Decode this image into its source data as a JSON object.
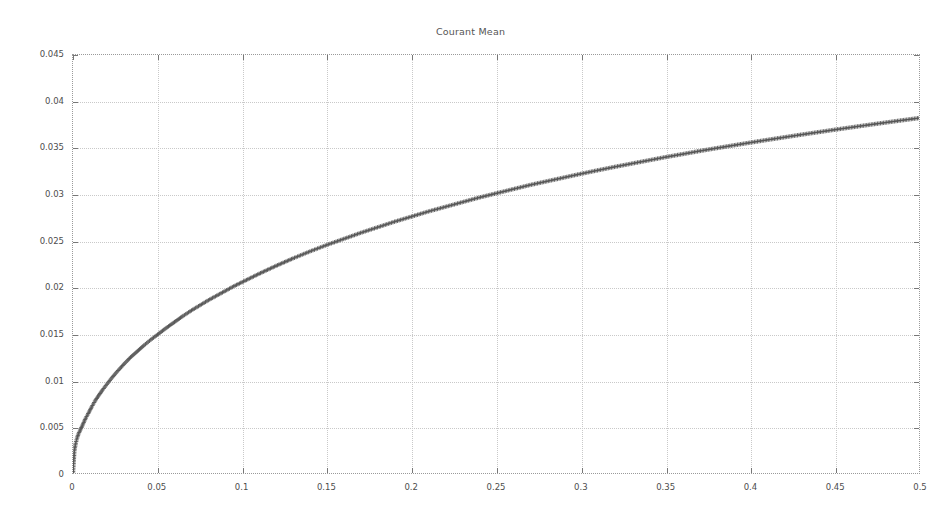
{
  "chart_data": {
    "type": "scatter",
    "title": "Courant Mean",
    "xlabel": "",
    "ylabel": "",
    "xlim": [
      0,
      0.5
    ],
    "ylim": [
      0,
      0.045
    ],
    "grid": true,
    "legend_position": "top-right",
    "x_ticks": [
      "0",
      "0.05",
      "0.1",
      "0.15",
      "0.2",
      "0.25",
      "0.3",
      "0.35",
      "0.4",
      "0.45",
      "0.5"
    ],
    "x_tick_values": [
      0,
      0.05,
      0.1,
      0.15,
      0.2,
      0.25,
      0.3,
      0.35,
      0.4,
      0.45,
      0.5
    ],
    "y_ticks": [
      "0",
      "0.005",
      "0.01",
      "0.015",
      "0.02",
      "0.025",
      "0.03",
      "0.035",
      "0.04",
      "0.045"
    ],
    "y_tick_values": [
      0,
      0.005,
      0.01,
      0.015,
      0.02,
      0.025,
      0.03,
      0.035,
      0.04,
      0.045
    ],
    "series": [
      {
        "name": "\"CourantMean_0\"",
        "marker": "plus",
        "color": "#555555",
        "x": [
          0.0,
          0.0008,
          0.0016,
          0.0024,
          0.0032,
          0.004,
          0.005,
          0.006,
          0.0075,
          0.009,
          0.011,
          0.013,
          0.015,
          0.0175,
          0.02,
          0.023,
          0.026,
          0.03,
          0.034,
          0.038,
          0.042,
          0.046,
          0.05,
          0.055,
          0.06,
          0.065,
          0.07,
          0.075,
          0.08,
          0.085,
          0.09,
          0.095,
          0.1,
          0.11,
          0.12,
          0.13,
          0.14,
          0.15,
          0.16,
          0.17,
          0.18,
          0.19,
          0.2,
          0.21,
          0.22,
          0.23,
          0.24,
          0.25,
          0.26,
          0.27,
          0.28,
          0.29,
          0.3,
          0.31,
          0.32,
          0.33,
          0.34,
          0.35,
          0.36,
          0.37,
          0.38,
          0.39,
          0.4,
          0.41,
          0.42,
          0.43,
          0.44,
          0.45,
          0.46,
          0.47,
          0.48,
          0.49,
          0.5
        ],
        "y": [
          0.0,
          0.0024,
          0.0032,
          0.00375,
          0.0042,
          0.0045,
          0.0049,
          0.0053,
          0.0059,
          0.0064,
          0.0071,
          0.00775,
          0.0083,
          0.00895,
          0.00955,
          0.01025,
          0.0109,
          0.0117,
          0.01245,
          0.0131,
          0.01375,
          0.01435,
          0.0149,
          0.0156,
          0.01625,
          0.0169,
          0.0175,
          0.01805,
          0.0186,
          0.0191,
          0.0196,
          0.0201,
          0.02055,
          0.02145,
          0.0223,
          0.0231,
          0.02385,
          0.02455,
          0.0252,
          0.02585,
          0.02645,
          0.02705,
          0.0276,
          0.02815,
          0.02865,
          0.02915,
          0.02965,
          0.0301,
          0.03055,
          0.031,
          0.0314,
          0.0318,
          0.0322,
          0.03258,
          0.03295,
          0.0333,
          0.03365,
          0.034,
          0.03432,
          0.03465,
          0.03496,
          0.03526,
          0.03556,
          0.03585,
          0.03613,
          0.03641,
          0.03668,
          0.03695,
          0.03721,
          0.03747,
          0.03772,
          0.03797,
          0.03821
        ]
      }
    ]
  }
}
